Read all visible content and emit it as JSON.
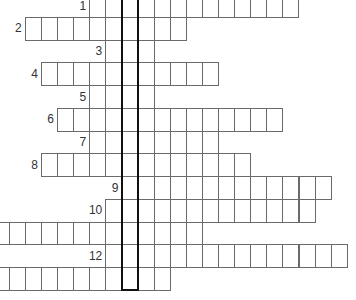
{
  "puzzle": {
    "type": "crossword-keyword",
    "cell_width": 16.1,
    "cell_height": 22.75,
    "origin_x": 8.7,
    "origin_y": -5.8,
    "line_color": "#6a6a6a",
    "key_column_color": "#111111",
    "key_column": {
      "col": 7,
      "row_start": 0,
      "row_end": 12
    },
    "rows": [
      {
        "label": "1",
        "start_col": 5,
        "length": 13
      },
      {
        "label": "2",
        "start_col": 1,
        "length": 10
      },
      {
        "label": "3",
        "start_col": 6,
        "length": 3
      },
      {
        "label": "4",
        "start_col": 2,
        "length": 11
      },
      {
        "label": "5",
        "start_col": 5,
        "length": 4
      },
      {
        "label": "6",
        "start_col": 3,
        "length": 14
      },
      {
        "label": "7",
        "start_col": 5,
        "length": 8
      },
      {
        "label": "8",
        "start_col": 2,
        "length": 13
      },
      {
        "label": "9",
        "start_col": 7,
        "length": 13
      },
      {
        "label": "10",
        "start_col": 6,
        "length": 13
      },
      {
        "label": "",
        "start_col": -1,
        "length": 13
      },
      {
        "label": "12",
        "start_col": 6,
        "length": 15
      },
      {
        "label": "",
        "start_col": -1,
        "length": 11
      }
    ]
  }
}
